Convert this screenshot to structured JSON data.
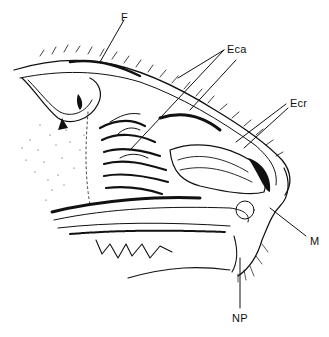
{
  "figure": {
    "type": "anatomical line drawing",
    "labels": [
      {
        "id": "F",
        "text": "F",
        "x": 121,
        "y": 12
      },
      {
        "id": "Eca",
        "text": "Eca",
        "x": 227,
        "y": 44
      },
      {
        "id": "Ecr",
        "text": "Ecr",
        "x": 290,
        "y": 98
      },
      {
        "id": "M",
        "text": "M",
        "x": 310,
        "y": 236
      },
      {
        "id": "NP",
        "text": "NP",
        "x": 232,
        "y": 313
      }
    ],
    "ink_color": "#111111",
    "background_color": "#ffffff"
  }
}
